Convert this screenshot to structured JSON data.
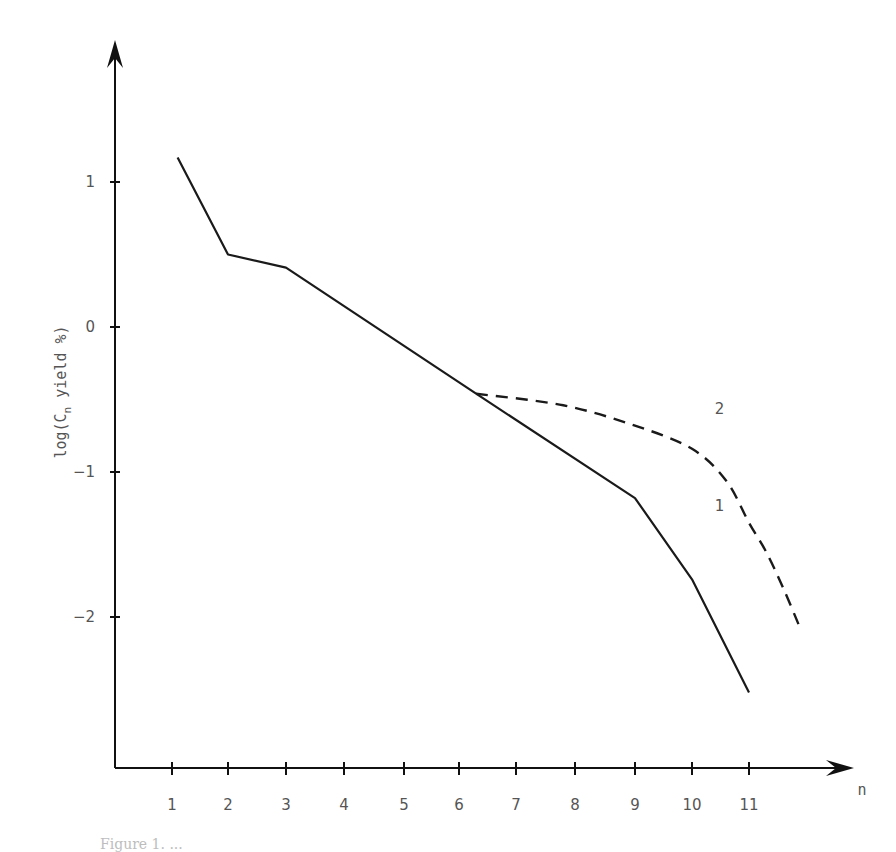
{
  "chart_data": {
    "type": "line",
    "title": "",
    "xlabel": "n",
    "ylabel": "log(Cn yield %)",
    "ylabel_main": "log(C",
    "ylabel_sub": "n",
    "ylabel_rest": " yield %)",
    "x_ticks": [
      1,
      2,
      3,
      4,
      5,
      6,
      7,
      8,
      9,
      10,
      11
    ],
    "y_ticks": [
      1,
      0,
      -1,
      -2
    ],
    "xlim": [
      0,
      12.3
    ],
    "ylim": [
      -3.0,
      1.9
    ],
    "grid": false,
    "legend": "inline labels",
    "series": [
      {
        "name": "1",
        "style": "solid",
        "x": [
          1.1,
          2.0,
          3.0,
          6.3,
          9.0,
          10.0,
          11.0
        ],
        "y": [
          1.17,
          0.5,
          0.41,
          -0.46,
          -1.18,
          -1.74,
          -2.52
        ]
      },
      {
        "name": "2",
        "style": "dashed",
        "x": [
          6.3,
          7.8,
          9.0,
          10.0,
          10.6,
          11.0,
          11.3,
          11.6,
          11.9
        ],
        "y": [
          -0.46,
          -0.54,
          -0.68,
          -0.84,
          -1.06,
          -1.35,
          -1.55,
          -1.8,
          -2.08
        ]
      }
    ],
    "annotations": [
      {
        "text": "1",
        "x": 10.4,
        "y": -1.27
      },
      {
        "text": "2",
        "x": 10.4,
        "y": -0.6
      }
    ]
  },
  "caption": "Figure 1. ..."
}
